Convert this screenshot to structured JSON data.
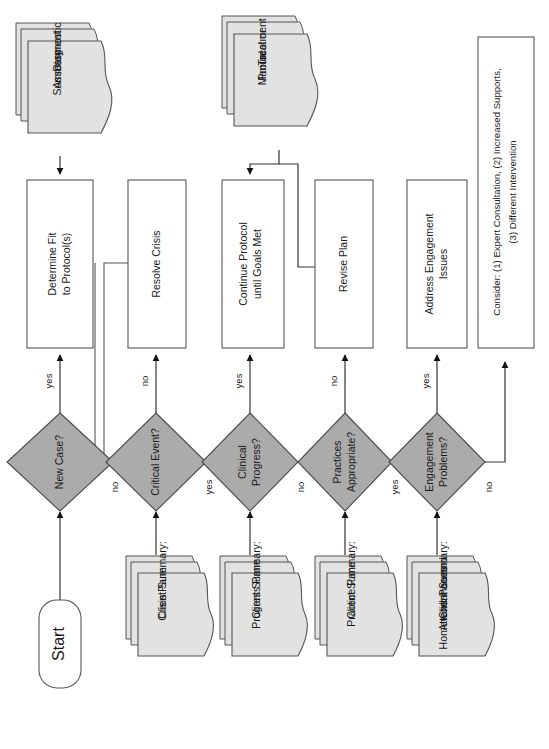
{
  "diagram": {
    "orientation": "rotated-90-ccw",
    "colors": {
      "decision_fill": "#ababab",
      "document_fill": "#e2e2e2",
      "process_fill": "#ffffff",
      "line": "#333333",
      "text": "#1a1a1a"
    }
  },
  "start": {
    "label": "Start"
  },
  "decisions": [
    {
      "id": "new-case",
      "label": "New Case?",
      "yes": "yes",
      "no": "no"
    },
    {
      "id": "critical-event",
      "label": "Critical Event?",
      "yes": "yes",
      "no": "no"
    },
    {
      "id": "clinical-progress",
      "label": "Clinical\nProgress?",
      "yes": "yes",
      "no": "no"
    },
    {
      "id": "practices-appropriate",
      "label": "Practices\nAppropriate?",
      "yes": "yes",
      "no": "no"
    },
    {
      "id": "engagement-problems",
      "label": "Engagement\nProblems?",
      "yes": "yes",
      "no": "no"
    }
  ],
  "decision_labels": {
    "new_case_line1": "New Case?",
    "critical_event_line1": "Critical Event?",
    "clinical_progress_line1": "Clinical",
    "clinical_progress_line2": "Progress?",
    "practices_line1": "Practices",
    "practices_line2": "Appropriate?",
    "engagement_line1": "Engagement",
    "engagement_line2": "Problems?"
  },
  "processes": {
    "determine_fit_line1": "Determine Fit",
    "determine_fit_line2": "to Protocol(s)",
    "resolve_crisis_line1": "Resolve Crisis",
    "continue_protocol_line1": "Continue Protocol",
    "continue_protocol_line2": "until Goals Met",
    "revise_plan_line1": "Revise Plan",
    "address_engagement_line1": "Address Engagement",
    "address_engagement_line2": "Issues",
    "consider_line1": "Consider: (1) Expert Consultation, (2) Increased Supports,",
    "consider_line2": "(3) Different Intervention"
  },
  "documents": {
    "diagnostic_line1": "Diagnostic",
    "diagnostic_line2": "Assessment",
    "diagnostic_line3": "Summary",
    "treatment_line1": "Treatment",
    "treatment_line2": "Protocol or",
    "treatment_line3": "Manual",
    "crisis_pane_line1": "Client Summary:",
    "crisis_pane_line2": "Crisis Pane",
    "progress_pane_line1": "Client Summary:",
    "progress_pane_line2": "Progress Pane",
    "practice_pane_line1": "Client Summary:",
    "practice_pane_line2": "Practice Pane",
    "attendance_pane_line1": "Client Summary:",
    "attendance_pane_line2": "Attendance and",
    "attendance_pane_line3": "Homework Panes"
  },
  "edge_labels": {
    "new_case_yes": "yes",
    "new_case_no": "no",
    "critical_event_no": "no",
    "critical_event_yes": "yes",
    "clinical_progress_yes": "yes",
    "clinical_progress_no": "no",
    "practices_no": "no",
    "practices_yes": "yes",
    "engagement_yes": "yes",
    "engagement_no": "no"
  }
}
